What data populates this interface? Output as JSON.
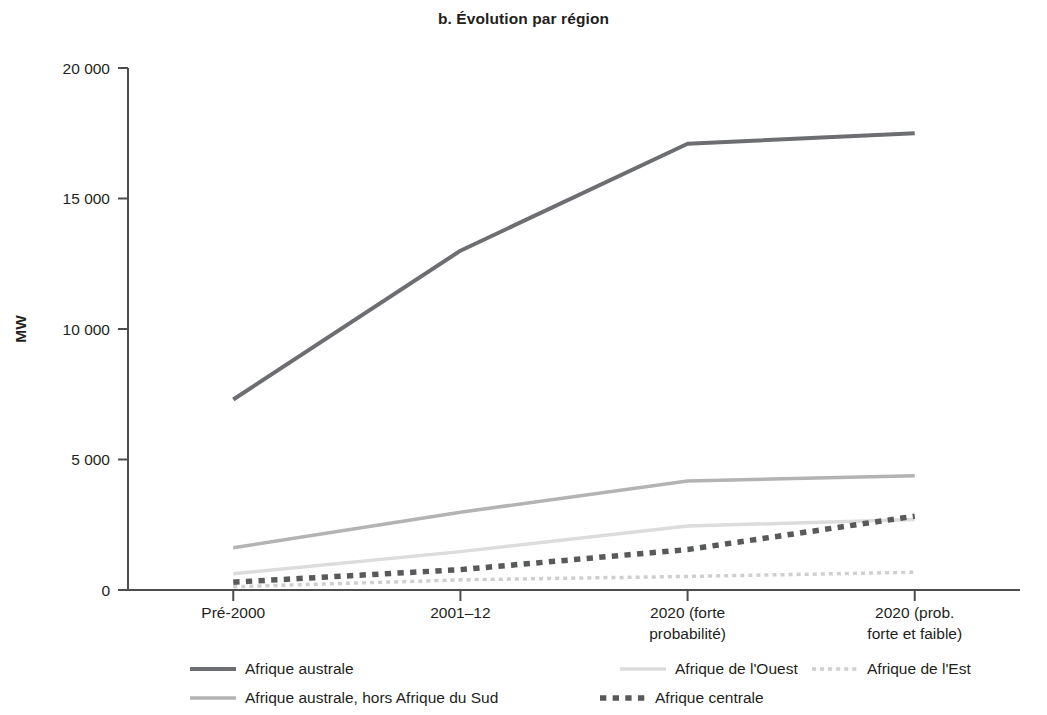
{
  "chart_data": {
    "type": "line",
    "title": "b. Évolution par région",
    "xlabel": "",
    "ylabel": "MW",
    "ylim": [
      0,
      20000
    ],
    "yticks": [
      0,
      5000,
      10000,
      15000,
      20000
    ],
    "ytick_labels": [
      "0",
      "5 000",
      "10 000",
      "15 000",
      "20 000"
    ],
    "grid": false,
    "legend_position": "bottom",
    "categories": [
      "Pré-2000",
      "2001–12",
      "2020 (forte probabilité)",
      "2020 (prob. forte et faible)"
    ],
    "category_lines": [
      [
        "Pré-2000"
      ],
      [
        "2001–12"
      ],
      [
        "2020 (forte",
        "probabilité)"
      ],
      [
        "2020 (prob.",
        "forte et faible)"
      ]
    ],
    "series": [
      {
        "name": "Afrique australe",
        "values": [
          7300,
          13000,
          17100,
          17500
        ],
        "color": "#6d6e71",
        "style": "solid",
        "width": 4
      },
      {
        "name": "Afrique australe, hors Afrique du Sud",
        "values": [
          1620,
          2980,
          4180,
          4380
        ],
        "color": "#b3b3b3",
        "style": "solid",
        "width": 3.5
      },
      {
        "name": "Afrique de l'Ouest",
        "values": [
          620,
          1470,
          2450,
          2700
        ],
        "color": "#dcdcdc",
        "style": "solid",
        "width": 3.5
      },
      {
        "name": "Afrique centrale",
        "values": [
          300,
          780,
          1550,
          2830
        ],
        "color": "#58595b",
        "style": "dashed",
        "width": 5.5
      },
      {
        "name": "Afrique de l'Est",
        "values": [
          120,
          390,
          520,
          680
        ],
        "color": "#cfcfcf",
        "style": "dashed",
        "width": 3.5
      }
    ],
    "legend_entries": [
      {
        "label": "Afrique australe",
        "row": 0,
        "col": 0
      },
      {
        "label": "Afrique de l'Ouest",
        "row": 0,
        "col": 1
      },
      {
        "label": "Afrique de l'Est",
        "row": 0,
        "col": 2
      },
      {
        "label": "Afrique australe, hors Afrique du Sud",
        "row": 1,
        "col": 0
      },
      {
        "label": "Afrique centrale",
        "row": 1,
        "col": 1
      }
    ],
    "axis_color": "#4d4d4d",
    "text_color": "#231f20"
  }
}
